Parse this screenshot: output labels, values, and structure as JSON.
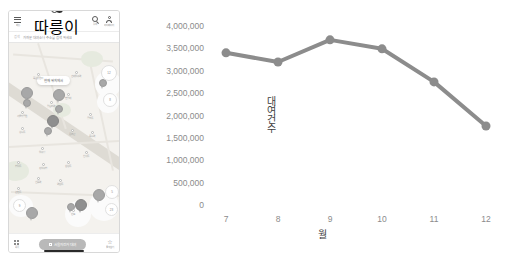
{
  "phone": {
    "topbar": {
      "menu_icon": "hamburger-menu-icon",
      "menu_label": "메뉴",
      "logo_label": "따릉이",
      "search_icon": "search-icon",
      "search_label": "검색",
      "profile_icon": "person-icon",
      "profile_label": "마이페이지"
    },
    "searchbar": {
      "prefix": "검색",
      "value": "가까운 대여소나 주소를 검색 하세요"
    },
    "map": {
      "popup_text": "현재 위치에서",
      "pois": [
        {
          "label": "서울숲공원"
        },
        {
          "label": "성수동"
        },
        {
          "label": "뚝섬유원지"
        },
        {
          "label": "건대입구역"
        },
        {
          "label": "왕십리역"
        },
        {
          "label": "한양대"
        },
        {
          "label": "응봉산"
        },
        {
          "label": "금호동"
        },
        {
          "label": "옥수역"
        },
        {
          "label": "압구정"
        },
        {
          "label": "신사동"
        },
        {
          "label": "청담동"
        },
        {
          "label": "강남구청"
        },
        {
          "label": "삼성동"
        },
        {
          "label": "선릉역"
        },
        {
          "label": "역삼동"
        },
        {
          "label": "논현동"
        },
        {
          "label": "반포"
        }
      ],
      "cluster_counts": [
        "12",
        "8",
        "5",
        "23",
        "9"
      ]
    },
    "bottom": {
      "grid_icon": "grid-icon",
      "grid_label": "목록",
      "cta_label": "서울자전거 대여",
      "star_icon": "star-icon",
      "star_label": "즐겨찾기"
    }
  },
  "chart_data": {
    "type": "line",
    "title": "",
    "xlabel": "월",
    "ylabel": "대여건수",
    "categories": [
      "7",
      "8",
      "9",
      "10",
      "11",
      "12"
    ],
    "x": [
      7,
      8,
      9,
      10,
      11,
      12
    ],
    "values": [
      3400000,
      3195000,
      3690000,
      3490000,
      2750000,
      1765000
    ],
    "series": [
      {
        "name": "대여건수",
        "values": [
          3400000,
          3195000,
          3690000,
          3490000,
          2750000,
          1765000
        ]
      }
    ],
    "ylim": [
      0,
      4000000
    ],
    "yticks": [
      0,
      500000,
      1000000,
      1500000,
      2000000,
      2500000,
      3000000,
      3500000,
      4000000
    ],
    "ytick_labels": [
      "0",
      "500,000",
      "1,000,000",
      "1,500,000",
      "2,000,000",
      "2,500,000",
      "3,000,000",
      "3,500,000",
      "4,000,000"
    ],
    "xtick_labels": [
      "7",
      "8",
      "9",
      "10",
      "11",
      "12"
    ],
    "grid": false,
    "legend": "none",
    "line_color": "#8c8c8c",
    "marker_color": "#8c8c8c",
    "marker_size": 9,
    "line_width": 4
  }
}
